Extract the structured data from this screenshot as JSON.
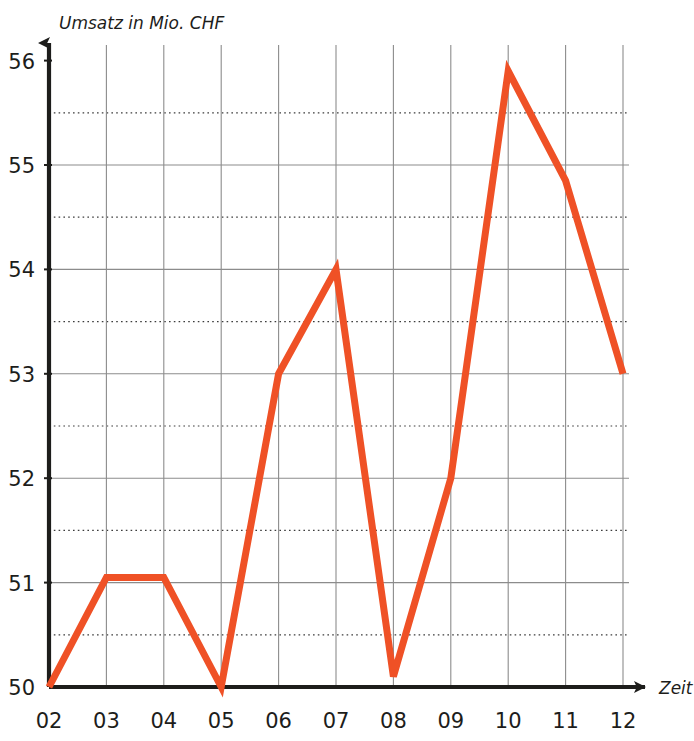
{
  "chart_data": {
    "type": "line",
    "title": "",
    "xlabel": "Zeit",
    "ylabel": "Umsatz in Mio. CHF",
    "categories": [
      "02",
      "03",
      "04",
      "05",
      "06",
      "07",
      "08",
      "09",
      "10",
      "11",
      "12"
    ],
    "values": [
      50.0,
      51.05,
      51.05,
      50.0,
      53.0,
      54.0,
      50.1,
      52.0,
      55.9,
      54.85,
      53.0
    ],
    "series": [
      {
        "name": "Umsatz",
        "color": "#ef5126",
        "values": [
          50.0,
          51.05,
          51.05,
          50.0,
          53.0,
          54.0,
          50.1,
          52.0,
          55.9,
          54.85,
          53.0
        ]
      }
    ],
    "ylim": [
      50,
      56
    ],
    "xlim": [
      "02",
      "12"
    ],
    "y_major_ticks": [
      50,
      51,
      52,
      53,
      54,
      55,
      56
    ],
    "y_major_tick_labels": [
      "50",
      "51",
      "52",
      "53",
      "54",
      "55",
      "56"
    ],
    "y_minor_ticks": [
      50.5,
      51.5,
      52.5,
      53.5,
      54.5,
      55.5
    ],
    "grid": {
      "major_style": "solid",
      "minor_style": "dotted",
      "major_color": "#8c8c8c",
      "minor_color": "#3c3c3c",
      "vertical": true,
      "horizontal": true
    },
    "legend": null,
    "axis_arrows": true,
    "axis_color": "#1d1d1b"
  },
  "axes": {
    "y_title": "Umsatz in Mio. CHF",
    "x_title": "Zeit"
  },
  "y_ticks": [
    {
      "label": "56",
      "value": 56
    },
    {
      "label": "55",
      "value": 55
    },
    {
      "label": "54",
      "value": 54
    },
    {
      "label": "53",
      "value": 53
    },
    {
      "label": "52",
      "value": 52
    },
    {
      "label": "51",
      "value": 51
    },
    {
      "label": "50",
      "value": 50
    }
  ],
  "x_ticks": [
    {
      "label": "02"
    },
    {
      "label": "03"
    },
    {
      "label": "04"
    },
    {
      "label": "05"
    },
    {
      "label": "06"
    },
    {
      "label": "07"
    },
    {
      "label": "08"
    },
    {
      "label": "09"
    },
    {
      "label": "10"
    },
    {
      "label": "11"
    },
    {
      "label": "12"
    }
  ]
}
